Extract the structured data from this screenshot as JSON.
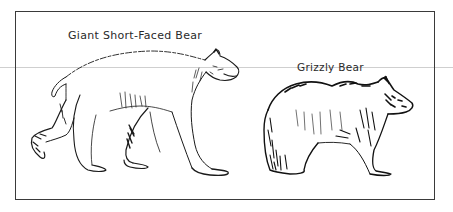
{
  "figure": {
    "labels": {
      "short_faced_bear": "Giant Short-Faced Bear",
      "grizzly_bear": "Grizzly Bear"
    },
    "colors": {
      "ink": "#1a1a1a",
      "frame": "#3a3a3a",
      "background": "#ffffff",
      "scan_line": "#cfcfcf"
    }
  }
}
